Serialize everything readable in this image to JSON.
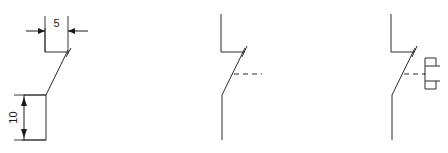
{
  "drawing": {
    "background_color": "#ffffff",
    "line_color": "#2b2b2b",
    "dimension_color": "#1a1a1a",
    "figures": [
      {
        "id": "figure-offset-bend-dimensioned",
        "name": "offset-bend-with-dimensions",
        "dimensions": [
          {
            "name": "horizontal-offset",
            "label": "5",
            "orientation": "horizontal"
          },
          {
            "name": "vertical-offset",
            "label": "10",
            "orientation": "vertical"
          }
        ]
      },
      {
        "id": "figure-switch-symbol",
        "name": "switch-contact-symbol",
        "dimensions": []
      },
      {
        "id": "figure-switch-with-actuator",
        "name": "switch-contact-with-actuator-bracket",
        "dimensions": []
      }
    ]
  }
}
